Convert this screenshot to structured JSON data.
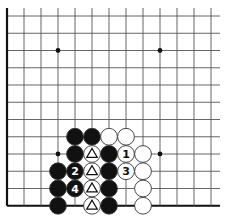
{
  "diagram": {
    "type": "go-board-fragment",
    "grid": {
      "columns": 13,
      "rows": 12,
      "origin_x": 7,
      "origin_y": 16,
      "spacing_x": 17,
      "spacing_y": 17.25,
      "extend_right": 220,
      "edges": [
        "left",
        "bottom"
      ]
    },
    "colors": {
      "line": "#555555",
      "edge": "#111111",
      "black_stone": "#111111",
      "white_stone": "#ffffff",
      "stone_outline": "#333333"
    },
    "hoshi": [
      {
        "c": 3,
        "r": 2
      },
      {
        "c": 9,
        "r": 2
      },
      {
        "c": 3,
        "r": 8
      },
      {
        "c": 9,
        "r": 8
      }
    ],
    "stones": [
      {
        "c": 4,
        "r": 7,
        "color": "black",
        "mark": ""
      },
      {
        "c": 5,
        "r": 7,
        "color": "black",
        "mark": ""
      },
      {
        "c": 6,
        "r": 7,
        "color": "white",
        "mark": ""
      },
      {
        "c": 7,
        "r": 7,
        "color": "white",
        "mark": ""
      },
      {
        "c": 4,
        "r": 8,
        "color": "black",
        "mark": ""
      },
      {
        "c": 5,
        "r": 8,
        "color": "white",
        "mark": "triangle"
      },
      {
        "c": 6,
        "r": 8,
        "color": "black",
        "mark": ""
      },
      {
        "c": 7,
        "r": 8,
        "color": "white",
        "mark": "1"
      },
      {
        "c": 8,
        "r": 8,
        "color": "white",
        "mark": ""
      },
      {
        "c": 3,
        "r": 9,
        "color": "black",
        "mark": ""
      },
      {
        "c": 4,
        "r": 9,
        "color": "black",
        "mark": "2"
      },
      {
        "c": 5,
        "r": 9,
        "color": "white",
        "mark": "triangle"
      },
      {
        "c": 6,
        "r": 9,
        "color": "black",
        "mark": ""
      },
      {
        "c": 7,
        "r": 9,
        "color": "white",
        "mark": "3"
      },
      {
        "c": 8,
        "r": 9,
        "color": "white",
        "mark": ""
      },
      {
        "c": 3,
        "r": 10,
        "color": "black",
        "mark": ""
      },
      {
        "c": 4,
        "r": 10,
        "color": "black",
        "mark": "4"
      },
      {
        "c": 5,
        "r": 10,
        "color": "white",
        "mark": "triangle"
      },
      {
        "c": 6,
        "r": 10,
        "color": "black",
        "mark": ""
      },
      {
        "c": 8,
        "r": 10,
        "color": "white",
        "mark": ""
      },
      {
        "c": 3,
        "r": 11,
        "color": "black",
        "mark": ""
      },
      {
        "c": 5,
        "r": 11,
        "color": "white",
        "mark": "triangle"
      },
      {
        "c": 6,
        "r": 11,
        "color": "black",
        "mark": ""
      },
      {
        "c": 8,
        "r": 11,
        "color": "white",
        "mark": ""
      }
    ]
  }
}
